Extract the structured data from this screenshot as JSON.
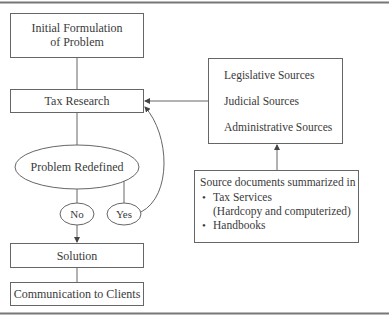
{
  "diagram": {
    "nodes": {
      "initial": {
        "line1": "Initial Formulation",
        "line2": "of Problem"
      },
      "tax_research": {
        "label": "Tax Research"
      },
      "problem_redefined": {
        "label": "Problem Redefined"
      },
      "no": {
        "label": "No"
      },
      "yes": {
        "label": "Yes"
      },
      "solution": {
        "label": "Solution"
      },
      "communication": {
        "label": "Communication to Clients"
      },
      "sources": {
        "items": [
          "Legislative Sources",
          "Judicial Sources",
          "Administrative Sources"
        ]
      },
      "source_docs": {
        "heading": "Source documents summarized in",
        "bullet": "•",
        "items": [
          "Tax Services",
          "(Hardcopy and computerized)",
          "Handbooks"
        ]
      }
    },
    "edges": [
      {
        "from": "initial",
        "to": "tax_research"
      },
      {
        "from": "tax_research",
        "to": "problem_redefined"
      },
      {
        "from": "problem_redefined",
        "to": "no"
      },
      {
        "from": "problem_redefined",
        "to": "yes"
      },
      {
        "from": "no",
        "to": "solution",
        "arrow": true
      },
      {
        "from": "yes",
        "to": "tax_research",
        "arrow": true
      },
      {
        "from": "solution",
        "to": "communication"
      },
      {
        "from": "sources",
        "to": "tax_research",
        "arrow": true
      },
      {
        "from": "source_docs",
        "to": "sources",
        "arrow": true
      }
    ],
    "colors": {
      "line": "#555555",
      "rule": "#777777",
      "text": "#3a3a3a"
    }
  }
}
